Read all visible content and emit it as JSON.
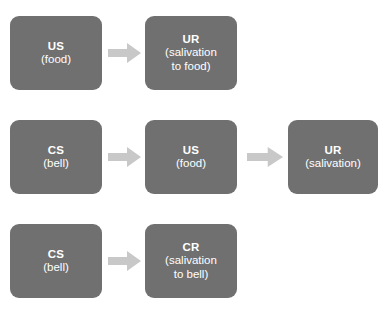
{
  "diagram": {
    "colors": {
      "node_fill": "#707070",
      "node_text": "#ffffff",
      "arrow_fill": "#c8c8c8",
      "background": "#ffffff"
    },
    "rows": [
      {
        "name": "before-conditioning",
        "nodes": [
          {
            "name": "node-us-food",
            "label": "US",
            "sub_lines": [
              "(food)"
            ],
            "x": 10,
            "width": 92
          },
          {
            "name": "node-ur-salivation-to-food",
            "label": "UR",
            "sub_lines": [
              "(salivation",
              "to food)"
            ],
            "x": 145,
            "width": 92
          }
        ],
        "arrows": [
          {
            "name": "arrow-us-to-ur",
            "x": 108,
            "width": 33
          }
        ],
        "y": 16
      },
      {
        "name": "during-conditioning",
        "nodes": [
          {
            "name": "node-cs-bell",
            "label": "CS",
            "sub_lines": [
              "(bell)"
            ],
            "x": 10,
            "width": 92
          },
          {
            "name": "node-us-food-2",
            "label": "US",
            "sub_lines": [
              "(food)"
            ],
            "x": 145,
            "width": 92
          },
          {
            "name": "node-ur-salivation",
            "label": "UR",
            "sub_lines": [
              "(salivation)"
            ],
            "x": 288,
            "width": 90
          }
        ],
        "arrows": [
          {
            "name": "arrow-cs-to-us",
            "x": 108,
            "width": 33
          },
          {
            "name": "arrow-us-to-ur-2",
            "x": 247,
            "width": 36
          }
        ],
        "y": 120
      },
      {
        "name": "after-conditioning",
        "nodes": [
          {
            "name": "node-cs-bell-2",
            "label": "CS",
            "sub_lines": [
              "(bell)"
            ],
            "x": 10,
            "width": 92
          },
          {
            "name": "node-cr-salivation-to-bell",
            "label": "CR",
            "sub_lines": [
              "(salivation",
              "to bell)"
            ],
            "x": 145,
            "width": 92
          }
        ],
        "arrows": [
          {
            "name": "arrow-cs-to-cr",
            "x": 108,
            "width": 33
          }
        ],
        "y": 224
      }
    ]
  }
}
